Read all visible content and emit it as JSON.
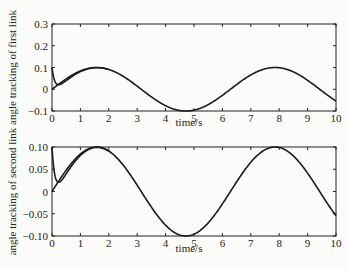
{
  "chart_data": [
    {
      "type": "line",
      "title": "",
      "xlabel": "time/s",
      "ylabel": "angle tracking of first link",
      "xlim": [
        0,
        10
      ],
      "ylim": [
        -0.1,
        0.3
      ],
      "xticks": [
        "0",
        "1",
        "2",
        "3",
        "4",
        "5",
        "6",
        "7",
        "8",
        "9",
        "10"
      ],
      "yticks": [
        "-0.1",
        "0",
        "0.1",
        "0.2",
        "0.3"
      ],
      "grid": false,
      "series": [
        {
          "name": "desired",
          "formula": "0.1*sin(t)",
          "x": [
            0,
            1,
            2,
            3,
            4,
            5,
            6,
            7,
            8,
            9,
            10
          ],
          "values": [
            0,
            0.084,
            0.091,
            0.014,
            -0.076,
            -0.096,
            -0.028,
            0.066,
            0.099,
            0.041,
            -0.054
          ]
        },
        {
          "name": "actual",
          "note": "starts at 0.1, dips to ~0.035 at t≈0.3, then converges to desired",
          "x": [
            0,
            0.1,
            0.3,
            0.6,
            1,
            2,
            3,
            4,
            5,
            6,
            7,
            8,
            9,
            10
          ],
          "values": [
            0.1,
            0.06,
            0.035,
            0.056,
            0.084,
            0.091,
            0.014,
            -0.076,
            -0.096,
            -0.028,
            0.066,
            0.099,
            0.041,
            -0.054
          ]
        }
      ]
    },
    {
      "type": "line",
      "title": "",
      "xlabel": "time/s",
      "ylabel": "angle tracking of second link",
      "xlim": [
        0,
        10
      ],
      "ylim": [
        -0.1,
        0.1
      ],
      "xticks": [
        "0",
        "1",
        "2",
        "3",
        "4",
        "5",
        "6",
        "7",
        "8",
        "9",
        "10"
      ],
      "yticks": [
        "-0.10",
        "-0.05",
        "0",
        "0.05",
        "0.10"
      ],
      "grid": false,
      "series": [
        {
          "name": "desired",
          "formula": "0.1*sin(t)",
          "x": [
            0,
            1,
            2,
            3,
            4,
            5,
            6,
            7,
            8,
            9,
            10
          ],
          "values": [
            0,
            0.084,
            0.091,
            0.014,
            -0.076,
            -0.096,
            -0.028,
            0.066,
            0.099,
            0.041,
            -0.054
          ]
        },
        {
          "name": "actual",
          "note": "starts at 0.1, dips to ~0.035 at t≈0.3, then converges to desired",
          "x": [
            0,
            0.1,
            0.3,
            0.6,
            1,
            2,
            3,
            4,
            5,
            6,
            7,
            8,
            9,
            10
          ],
          "values": [
            0.1,
            0.06,
            0.035,
            0.056,
            0.084,
            0.091,
            0.014,
            -0.076,
            -0.096,
            -0.028,
            0.066,
            0.099,
            0.041,
            -0.054
          ]
        }
      ]
    }
  ],
  "panels": {
    "top": {
      "ylabel": "angle tracking of first link",
      "xlabel": "time/s"
    },
    "bottom": {
      "ylabel": "angle tracking of second link",
      "xlabel": "time/s"
    }
  }
}
